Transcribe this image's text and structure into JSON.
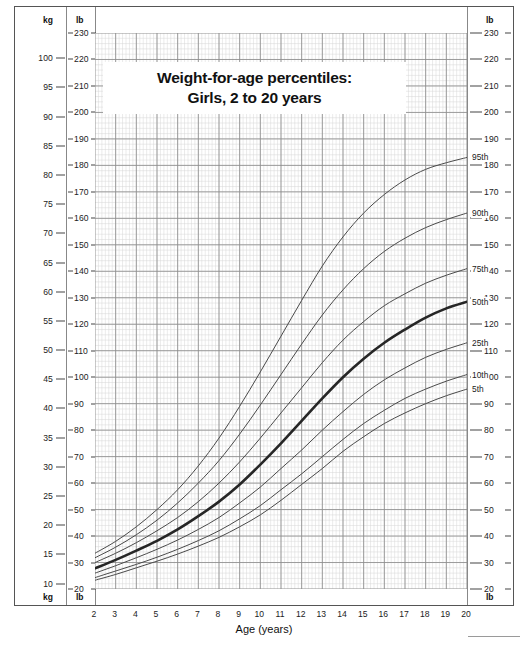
{
  "title": {
    "line1": "Weight-for-age percentiles:",
    "line2": "Girls, 2 to 20 years"
  },
  "axes": {
    "left_unit_top_kg": "kg",
    "left_unit_top_lb": "lb",
    "left_unit_bottom_kg": "kg",
    "left_unit_bottom_lb": "lb",
    "right_unit_top_lb": "lb",
    "right_unit_bottom_lb": "lb",
    "x_title": "Age (years)",
    "kg_ticks": [
      105,
      100,
      95,
      90,
      85,
      80,
      75,
      70,
      65,
      60,
      55,
      50,
      45,
      40,
      35,
      30,
      25,
      20,
      15,
      10
    ],
    "lb_ticks": [
      230,
      220,
      210,
      200,
      190,
      180,
      170,
      160,
      150,
      140,
      130,
      120,
      110,
      100,
      90,
      80,
      70,
      60,
      50,
      40,
      30,
      20
    ],
    "x_ticks": [
      2,
      3,
      4,
      5,
      6,
      7,
      8,
      9,
      10,
      11,
      12,
      13,
      14,
      15,
      16,
      17,
      18,
      19,
      20
    ]
  },
  "colors": {
    "curve": "#4a4a4a",
    "curve_bold": "#262626",
    "grid_major": "#8c8c8c",
    "grid_minor": "#d7d7d7",
    "frame": "#555555",
    "text": "#1a1a1a"
  },
  "chart_data": {
    "type": "line",
    "title": "Weight-for-age percentiles: Girls, 2 to 20 years",
    "xlabel": "Age (years)",
    "ylabel": "Weight (kg / lb)",
    "xlim": [
      2,
      20
    ],
    "ylim_lb": [
      20,
      230
    ],
    "ylim_kg": [
      9,
      105
    ],
    "grid": true,
    "legend": "inline-right-end-labels",
    "x": [
      2,
      3,
      4,
      5,
      6,
      7,
      8,
      9,
      10,
      11,
      12,
      13,
      14,
      15,
      16,
      17,
      18,
      19,
      20
    ],
    "series": [
      {
        "name": "95th",
        "label": "95th",
        "units": "lb",
        "values": [
          33.5,
          38.0,
          43.5,
          50.0,
          57.5,
          66.5,
          77.0,
          89.0,
          102.0,
          115.5,
          129.0,
          142.0,
          153.0,
          162.0,
          169.0,
          174.5,
          178.5,
          181.0,
          183.0
        ]
      },
      {
        "name": "90th",
        "label": "90th",
        "units": "lb",
        "values": [
          31.8,
          35.8,
          40.5,
          46.0,
          52.5,
          60.0,
          68.5,
          78.5,
          89.5,
          101.0,
          112.5,
          123.5,
          133.0,
          141.0,
          147.5,
          152.5,
          156.5,
          159.5,
          162.0
        ]
      },
      {
        "name": "75th",
        "label": "75th",
        "units": "lb",
        "values": [
          30.0,
          33.5,
          37.5,
          42.0,
          47.0,
          53.0,
          60.0,
          68.0,
          77.0,
          86.5,
          96.0,
          105.5,
          114.0,
          121.0,
          127.0,
          131.5,
          135.5,
          138.5,
          141.0
        ]
      },
      {
        "name": "50th",
        "label": "50th",
        "units": "lb",
        "emphasis": true,
        "values": [
          27.8,
          31.0,
          34.5,
          38.2,
          42.5,
          47.5,
          53.0,
          59.5,
          67.0,
          75.0,
          83.5,
          92.0,
          100.0,
          107.0,
          113.0,
          118.0,
          122.5,
          126.0,
          128.5
        ]
      },
      {
        "name": "25th",
        "label": "25th",
        "units": "lb",
        "values": [
          26.0,
          28.8,
          31.8,
          35.0,
          38.5,
          42.5,
          47.0,
          52.5,
          58.5,
          65.5,
          72.5,
          80.0,
          87.0,
          93.5,
          99.0,
          103.5,
          107.5,
          110.5,
          113.0
        ]
      },
      {
        "name": "10th",
        "label": "10th",
        "units": "lb",
        "values": [
          24.3,
          26.8,
          29.3,
          32.0,
          35.0,
          38.3,
          42.0,
          46.5,
          51.5,
          57.5,
          63.5,
          70.0,
          76.5,
          82.5,
          87.5,
          92.0,
          95.5,
          98.5,
          101.0
        ]
      },
      {
        "name": "5th",
        "label": "5th",
        "units": "lb",
        "values": [
          23.3,
          25.5,
          28.0,
          30.5,
          33.2,
          36.2,
          39.5,
          43.5,
          48.0,
          53.5,
          59.5,
          65.5,
          72.0,
          77.5,
          82.5,
          86.5,
          90.0,
          93.0,
          95.5
        ]
      }
    ]
  }
}
